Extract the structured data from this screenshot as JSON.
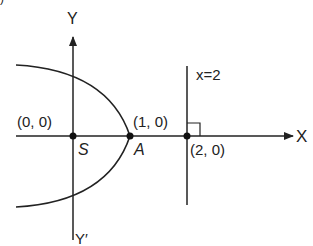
{
  "figure": {
    "type": "parabola-with-directrix",
    "colors": {
      "stroke": "#222222",
      "background": "#ffffff"
    },
    "axes": {
      "x_label": "X",
      "y_label": "Y",
      "y_neg_label": "Y′"
    },
    "directrix": {
      "label": "x=2"
    },
    "points": [
      {
        "name": "S",
        "coord_label": "(0, 0)"
      },
      {
        "name": "A",
        "coord_label": "(1, 0)"
      },
      {
        "name": "",
        "coord_label": "(2, 0)"
      }
    ],
    "corner_fragment": ")"
  }
}
